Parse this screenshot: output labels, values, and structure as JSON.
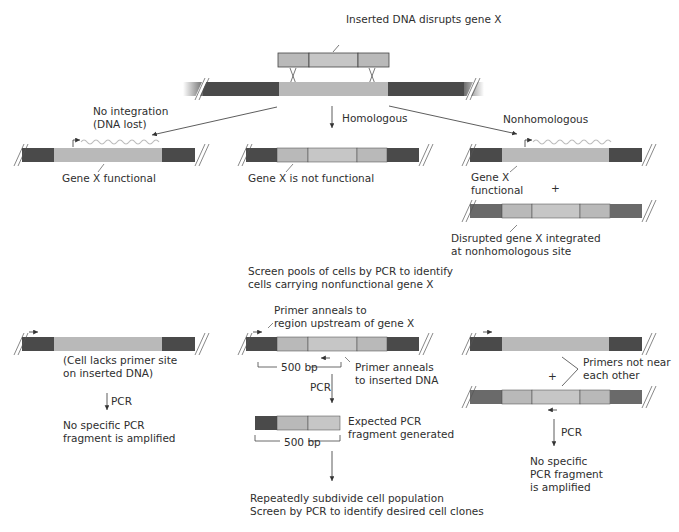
{
  "colors": {
    "flank": "#4a4a4a",
    "flank_light": "#6e6e6e",
    "gene": "#b9b9b9",
    "insert": "#c4c4c4",
    "line": "#333333",
    "wave": "#bdbdbd"
  },
  "top": {
    "insert_label": "Inserted DNA disrupts gene X"
  },
  "branches": {
    "no_integration": {
      "label": "No integration\n(DNA lost)",
      "gene_label": "Gene X functional"
    },
    "homologous": {
      "label": "Homologous",
      "gene_label": "Gene X is not functional"
    },
    "nonhomologous": {
      "label": "Nonhomologous",
      "gene_label": "Gene X\nfunctional",
      "plus": "+",
      "disrupted_label": "Disrupted gene X integrated\nat nonhomologous site"
    }
  },
  "screen": {
    "title": "Screen pools of cells by PCR to identify\ncells carrying nonfunctional gene X"
  },
  "pcr_left": {
    "note": "(Cell lacks primer site\non inserted DNA)",
    "pcr_label": "PCR",
    "result": "No specific PCR\nfragment is amplified"
  },
  "pcr_middle": {
    "primer_upstream": "Primer anneals to\nregion upstream of gene X",
    "primer_insert": "Primer anneals\nto inserted DNA",
    "span_label": "500 bp",
    "pcr_label": "PCR",
    "fragment_label": "Expected PCR\nfragment generated",
    "fragment_span": "500 bp",
    "final": "Repeatedly subdivide cell population\nScreen by PCR to identify desired cell clones"
  },
  "pcr_right": {
    "plus": "+",
    "primers_note": "Primers not near\neach other",
    "pcr_label": "PCR",
    "result": "No specific\nPCR fragment\nis amplified"
  }
}
